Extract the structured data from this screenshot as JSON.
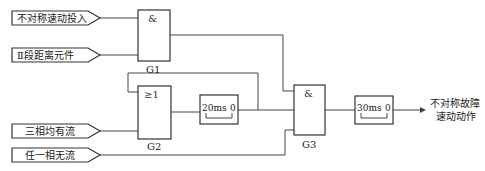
{
  "inputs": [
    {
      "id": "in1",
      "label": "不对称速动投入"
    },
    {
      "id": "in2",
      "label": "Ⅱ段距离元件"
    },
    {
      "id": "in3",
      "label": "三相均有流"
    },
    {
      "id": "in4",
      "label": "任一相无流"
    }
  ],
  "gates": {
    "g1": {
      "name": "G1",
      "symbol": "&"
    },
    "g2": {
      "name": "G2",
      "symbol": "≥1"
    },
    "g3": {
      "name": "G3",
      "symbol": "&"
    }
  },
  "timers": {
    "t1": {
      "on_delay": "20ms",
      "off_delay": "0"
    },
    "t2": {
      "on_delay": "30ms",
      "off_delay": "0"
    }
  },
  "output": {
    "line1": "不对称故障",
    "line2": "速动动作"
  },
  "colors": {
    "line": "#444444",
    "background": "#ffffff"
  }
}
